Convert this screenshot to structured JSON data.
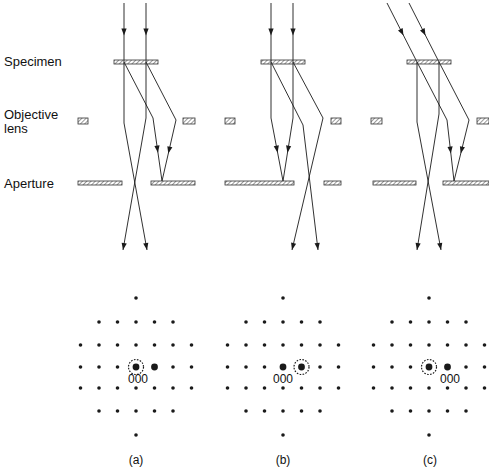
{
  "labels": {
    "specimen": "Specimen",
    "objective_line1": "Objective",
    "objective_line2": "lens",
    "aperture": "Aperture"
  },
  "panels": [
    {
      "id": "a",
      "caption": "(a)",
      "center_x": 136,
      "beam": "axial",
      "aperture_selects": "direct",
      "circled_offset": 0,
      "bright_offsets": [
        0,
        1
      ],
      "index_label": "000",
      "index_label_x": 128
    },
    {
      "id": "b",
      "caption": "(b)",
      "center_x": 283,
      "beam": "axial",
      "aperture_selects": "diffracted",
      "circled_offset": 1,
      "bright_offsets": [
        0,
        1
      ],
      "index_label": "000",
      "index_label_x": 273
    },
    {
      "id": "c",
      "caption": "(c)",
      "center_x": 429,
      "beam": "tilted",
      "aperture_selects": "diffracted-on-axis",
      "circled_offset": 0,
      "bright_offsets": [
        0,
        1
      ],
      "index_label": "000",
      "index_label_x": 440
    }
  ],
  "pattern": {
    "rows_y": [
      298,
      322,
      345,
      367,
      388,
      411,
      435
    ],
    "row_halfwidth": [
      0,
      2,
      3,
      3,
      3,
      2,
      0
    ],
    "spacing": 18.5,
    "center_row": 3
  },
  "colors": {
    "ink": "#1a1a1a",
    "background": "#ffffff"
  }
}
